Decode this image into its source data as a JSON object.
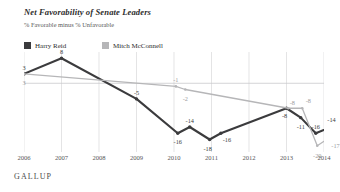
{
  "chart_data": {
    "type": "line",
    "title": "Net Favorability of Senate Leaders",
    "subtitle": "% Favorable minus % Unfavorable",
    "xlabel": "",
    "ylabel": "",
    "grid": true,
    "legend_position": "top-left",
    "xlim": [
      2006,
      2014
    ],
    "ylim": [
      -22,
      10
    ],
    "zero_line": 0,
    "source": "GALLUP",
    "categories": [
      "2006",
      "2007",
      "2008",
      "2009",
      "2010",
      "2011",
      "2012",
      "2013",
      "2014"
    ],
    "series": [
      {
        "name": "Harry Reid",
        "color": "#3b3b3d",
        "points": [
          {
            "x": 2006.0,
            "y": 3,
            "label": "3"
          },
          {
            "x": 2007.0,
            "y": 8,
            "label": "8"
          },
          {
            "x": 2009.0,
            "y": -5,
            "label": "-5"
          },
          {
            "x": 2010.1,
            "y": -16,
            "label": "-16"
          },
          {
            "x": 2010.42,
            "y": -14,
            "label": "-14"
          },
          {
            "x": 2010.95,
            "y": -18,
            "label": "-18"
          },
          {
            "x": 2011.25,
            "y": -16,
            "label": "-16"
          },
          {
            "x": 2013.0,
            "y": -8,
            "label": "-8"
          },
          {
            "x": 2013.38,
            "y": -11,
            "label": "-11"
          },
          {
            "x": 2013.78,
            "y": -16,
            "label": "-16"
          },
          {
            "x": 2014.2,
            "y": -14,
            "label": "-14"
          }
        ]
      },
      {
        "name": "Mitch McConnell",
        "color": "#b6b6b8",
        "points": [
          {
            "x": 2006.0,
            "y": 3,
            "label": "3"
          },
          {
            "x": 2010.05,
            "y": -1,
            "label": "-1"
          },
          {
            "x": 2010.3,
            "y": -2,
            "label": "-2"
          },
          {
            "x": 2013.05,
            "y": -8,
            "label": "-8"
          },
          {
            "x": 2013.42,
            "y": -8,
            "label": "-8"
          },
          {
            "x": 2013.82,
            "y": -20,
            "label": "-20"
          },
          {
            "x": 2014.2,
            "y": -17,
            "label": "-17"
          }
        ]
      }
    ]
  },
  "legend": {
    "items": [
      {
        "label": "Harry Reid",
        "color": "#3b3b3d"
      },
      {
        "label": "Mitch McConnell",
        "color": "#b6b6b8"
      }
    ]
  },
  "footer": {
    "source": "GALLUP"
  },
  "colors": {
    "reid": "#3b3b3d",
    "mcconnell": "#b6b6b8",
    "grid": "#d8d8da",
    "zero": "#c9c9cb",
    "text": "#3a3a3a"
  }
}
